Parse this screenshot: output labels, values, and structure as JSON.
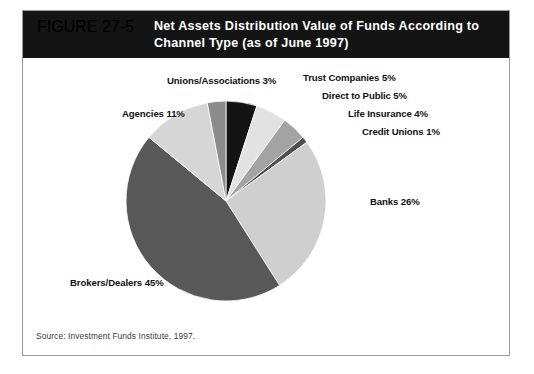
{
  "figure": {
    "number_label": "FIGURE 27-5",
    "title_line1": "Net Assets Distribution Value of Funds According to",
    "title_line2": "Channel Type (as of June 1997)",
    "source_note": "Source: Investment Funds Institute, 1997."
  },
  "labels": {
    "unions": "Unions/Associations 3%",
    "trust": "Trust Companies 5%",
    "direct": "Direct to Public 5%",
    "life": "Life Insurance 4%",
    "credit": "Credit Unions 1%",
    "agencies": "Agencies 11%",
    "banks": "Banks 26%",
    "brokers": "Brokers/Dealers 45%"
  },
  "chart_data": {
    "type": "pie",
    "title": "Net Assets Distribution Value of Funds According to Channel Type (as of June 1997)",
    "xlabel": "",
    "ylabel": "",
    "units": "percent",
    "total": 100,
    "start_angle_deg": 0,
    "direction": "clockwise",
    "legend": "callout labels around pie",
    "grid": false,
    "categories": [
      "Trust Companies",
      "Direct to Public",
      "Life Insurance",
      "Credit Unions",
      "Banks",
      "Brokers/Dealers",
      "Agencies",
      "Unions/Associations"
    ],
    "values": [
      5,
      5,
      4,
      1,
      26,
      45,
      11,
      3
    ],
    "slices": [
      {
        "name": "Trust Companies",
        "value": 5,
        "label": "Trust Companies 5%",
        "color": "#141414"
      },
      {
        "name": "Direct to Public",
        "value": 5,
        "label": "Direct to Public 5%",
        "color": "#e2e2e2"
      },
      {
        "name": "Life Insurance",
        "value": 4,
        "label": "Life Insurance 4%",
        "color": "#a3a3a3"
      },
      {
        "name": "Credit Unions",
        "value": 1,
        "label": "Credit Unions 1%",
        "color": "#4f4f4f"
      },
      {
        "name": "Banks",
        "value": 26,
        "label": "Banks 26%",
        "color": "#cfcfcf"
      },
      {
        "name": "Brokers/Dealers",
        "value": 45,
        "label": "Brokers/Dealers 45%",
        "color": "#585858"
      },
      {
        "name": "Agencies",
        "value": 11,
        "label": "Agencies 11%",
        "color": "#d6d6d6"
      },
      {
        "name": "Unions/Associations",
        "value": 3,
        "label": "Unions/Associations 3%",
        "color": "#8c8c8c"
      }
    ]
  },
  "colors": {
    "banner_background": "#141414",
    "banner_text": "#ffffff",
    "frame_border": "#9a9a9a",
    "page_background": "#ffffff",
    "label_text": "#111111",
    "source_text": "#3a3a3a"
  }
}
